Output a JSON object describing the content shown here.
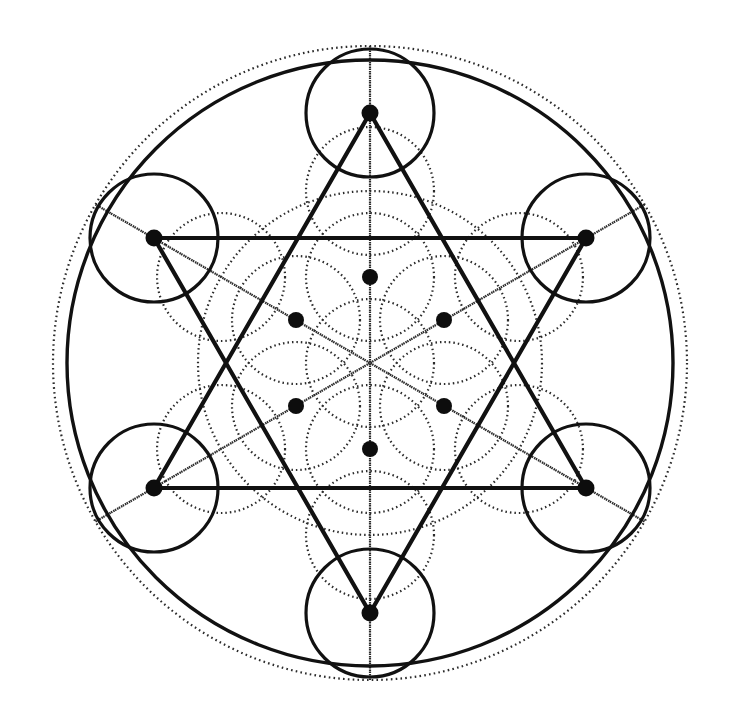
{
  "figure": {
    "background_color": "#ffffff",
    "stroke_color": "#111111",
    "dotted_stroke_color": "#2b2b2b",
    "vertex_fill_color": "#0d0d0d",
    "canvas": {
      "width": 738,
      "height": 723
    }
  },
  "geometry": {
    "center": {
      "x": 370,
      "y": 363
    },
    "outer_dotted_circle": {
      "cx": 370,
      "cy": 363,
      "r": 317,
      "stroke_width": 2.2,
      "dash": "1.6 3.2"
    },
    "outer_solid_circle": {
      "cx": 370,
      "cy": 363,
      "r": 303,
      "stroke_width": 3.4
    },
    "outer_vertex_radius": 250,
    "outer_vertex_circle_radius": 64,
    "outer_vertex_circle_stroke_width": 3.2,
    "inner_vertex_radius": 86,
    "petal_circle_radius": 64,
    "hexagram_stroke_width": 4.2,
    "dotted_stroke_width": 2.2,
    "dotted_dash": "1.5 3.0",
    "vertex_dot_radius": 8.5,
    "inner_vertex_dot_radius": 8.0,
    "outer_vertices": [
      {
        "name": "vertex-top",
        "angle_deg": -90,
        "x": 370,
        "y": 113
      },
      {
        "name": "vertex-upper-right",
        "angle_deg": -30,
        "x": 586,
        "y": 238
      },
      {
        "name": "vertex-lower-right",
        "angle_deg": 30,
        "x": 586,
        "y": 488
      },
      {
        "name": "vertex-bottom",
        "angle_deg": 90,
        "x": 370,
        "y": 613
      },
      {
        "name": "vertex-lower-left",
        "angle_deg": 150,
        "x": 154,
        "y": 488
      },
      {
        "name": "vertex-upper-left",
        "angle_deg": 210,
        "x": 154,
        "y": 238
      }
    ],
    "inner_vertices": [
      {
        "name": "inner-vertex-top",
        "angle_deg": -90,
        "x": 370,
        "y": 277
      },
      {
        "name": "inner-vertex-upper-right",
        "angle_deg": -30,
        "x": 444,
        "y": 320
      },
      {
        "name": "inner-vertex-lower-right",
        "angle_deg": 30,
        "x": 444,
        "y": 406
      },
      {
        "name": "inner-vertex-bottom",
        "angle_deg": 90,
        "x": 370,
        "y": 449
      },
      {
        "name": "inner-vertex-lower-left",
        "angle_deg": 150,
        "x": 296,
        "y": 406
      },
      {
        "name": "inner-vertex-upper-left",
        "angle_deg": 210,
        "x": 296,
        "y": 320
      }
    ],
    "triangle_up": [
      "vertex-top",
      "vertex-lower-right",
      "vertex-lower-left"
    ],
    "triangle_down": [
      "vertex-bottom",
      "vertex-upper-left",
      "vertex-upper-right"
    ],
    "dotted_diameters": 6,
    "flower_petal_centers": 6,
    "marked_vertex_dots": 12
  }
}
